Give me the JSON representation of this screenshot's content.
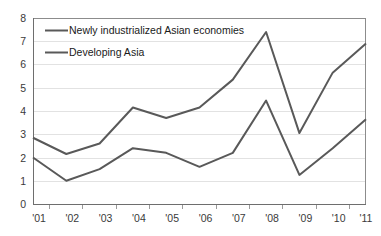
{
  "chart_data": {
    "type": "line",
    "title": "",
    "xlabel": "",
    "ylabel": "",
    "categories": [
      "'01",
      "'02",
      "'03",
      "'04",
      "'05",
      "'06",
      "'07",
      "'08",
      "'09",
      "'10",
      "'11"
    ],
    "ylim": [
      0,
      8
    ],
    "yticks": [
      "0",
      "1",
      "2",
      "3",
      "4",
      "5",
      "6",
      "7",
      "8"
    ],
    "grid": true,
    "legend_position": "top-left",
    "series": [
      {
        "name": "Newly industrialized Asian economies",
        "color": "#595959",
        "values": [
          2.85,
          2.15,
          2.6,
          4.15,
          3.7,
          4.15,
          5.35,
          7.4,
          3.05,
          5.65,
          6.9
        ]
      },
      {
        "name": "Developing Asia",
        "color": "#595959",
        "values": [
          2.0,
          1.0,
          1.5,
          2.4,
          2.2,
          1.6,
          2.2,
          4.45,
          1.25,
          2.4,
          3.65
        ]
      }
    ]
  },
  "axes": {
    "y_tick_labels": [
      "8",
      "7",
      "6",
      "5",
      "4",
      "3",
      "2",
      "1",
      "0"
    ],
    "x_tick_labels": [
      "'01",
      "'02",
      "'03",
      "'04",
      "'05",
      "'06",
      "'07",
      "'08",
      "'09",
      "'10",
      "'11"
    ]
  },
  "legend": {
    "items": [
      {
        "label": "Newly industrialized Asian economies"
      },
      {
        "label": "Developing Asia"
      }
    ]
  },
  "colors": {
    "series_line": "#595959",
    "gridline": "#e2e2e2",
    "axis": "#6e6e6e",
    "text": "#3a3a3a",
    "background": "#ffffff"
  }
}
